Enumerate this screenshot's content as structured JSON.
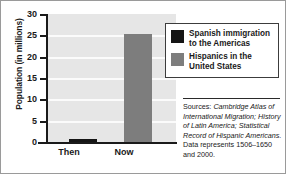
{
  "chart_data": {
    "type": "bar",
    "title": "",
    "xlabel": "",
    "ylabel": "Population (in millions)",
    "categories": [
      "Then",
      "Now"
    ],
    "values": [
      0.4,
      25.3
    ],
    "series": [
      {
        "name": "Spanish immigration to the Americas",
        "category": "Then",
        "value": 0.4,
        "color": "#151515"
      },
      {
        "name": "Hispanics in the United States",
        "category": "Now",
        "value": 25.3,
        "color": "#7d7d7d"
      }
    ],
    "ylim": [
      0,
      30
    ],
    "ytick_values": [
      30,
      25,
      20,
      15,
      10,
      5,
      0
    ],
    "ytick_labels": [
      "30",
      "25",
      "20",
      "15",
      "10",
      "5",
      "0"
    ],
    "grid": true,
    "legend_position": "right-top",
    "plot_background": "#e6e6e6",
    "gridline_color": "#fbfbfb"
  },
  "axis": {
    "y_title": "Population (in millions)",
    "ticks": [
      "30",
      "25",
      "20",
      "15",
      "10",
      "5",
      "0"
    ],
    "categories": [
      "Then",
      "Now"
    ]
  },
  "legend": {
    "items": [
      {
        "label_line1": "Spanish immigration",
        "label_line2": "to the Americas",
        "color": "#151515"
      },
      {
        "label_line1": "Hispanics in the",
        "label_line2": "United States",
        "color": "#7d7d7d"
      }
    ]
  },
  "sources": {
    "prefix": "Sources:",
    "italic_part": "Cambridge Atlas of International Migration; History of Latin America; Statistical Record of Hispanic Americans.",
    "note": "Data represents 1506–1650 and 2000.",
    "full_text": "Sources: Cambridge Atlas of International Migration; History of Latin America; Statistical Record of Hispanic Americans. Data represents 1506–1650 and 2000."
  }
}
